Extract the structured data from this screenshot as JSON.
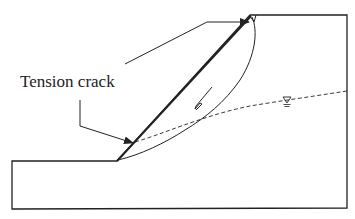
{
  "diagram": {
    "labels": {
      "tension_crack": "Tension crack"
    },
    "symbols": {
      "water_table": "water-table-triangle"
    },
    "colors": {
      "line": "#222222",
      "background": "#ffffff"
    }
  }
}
